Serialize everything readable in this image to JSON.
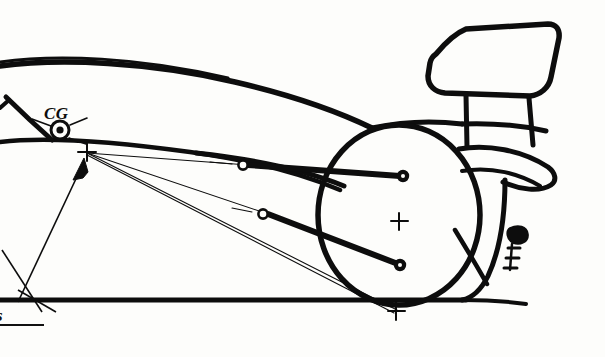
{
  "figure": {
    "type": "technical-line-drawing",
    "medium": "hand-drawn ink sketch",
    "background_color": "#fdfdfb",
    "ink_color": "#0d0d0d",
    "width": 605,
    "height": 357
  },
  "labels": {
    "cg": "CG",
    "cg_meaning": "center of gravity",
    "roll_center_height": "s",
    "roll_center_height_underlined": true
  },
  "markers": {
    "cg_symbol": {
      "name": "center-of-gravity-symbol",
      "x": 60,
      "y": 130,
      "outer_radius": 9,
      "inner_dot_radius": 3.5,
      "tick_count": 3
    },
    "instant_center_cross": {
      "name": "instant-center-cross",
      "x": 86,
      "y": 152,
      "size": 9
    },
    "wheel_center_cross": {
      "name": "wheel-center-cross",
      "x": 399,
      "y": 221,
      "size": 9
    },
    "contact_patch_cross": {
      "name": "tire-contact-patch-cross",
      "x": 396,
      "y": 311,
      "size": 9
    }
  },
  "wheel": {
    "name": "rear-wheel",
    "center_x": 399,
    "center_y": 215,
    "radius_x": 81,
    "radius_y": 90,
    "stroke_width": 5
  },
  "pivots": {
    "upper_inboard": {
      "x": 243,
      "y": 165,
      "style": "hollow",
      "radius": 4.5
    },
    "lower_inboard": {
      "x": 263,
      "y": 214,
      "style": "hollow",
      "radius": 4.5
    },
    "upper_outboard": {
      "x": 403,
      "y": 176,
      "style": "filled",
      "radius": 5
    },
    "lower_outboard": {
      "x": 400,
      "y": 265,
      "style": "filled",
      "radius": 5
    }
  },
  "arms": {
    "upper_control_arm": {
      "from_x": 243,
      "from_y": 165,
      "to_x": 403,
      "to_y": 176,
      "stroke_width": 6
    },
    "lower_control_arm": {
      "from_x": 263,
      "from_y": 214,
      "to_x": 400,
      "to_y": 265,
      "stroke_width": 6
    }
  },
  "construction_lines": [
    {
      "name": "upper-arm-projection",
      "from_x": 86,
      "from_y": 152,
      "to_x": 243,
      "to_y": 165
    },
    {
      "name": "lower-arm-projection",
      "from_x": 86,
      "from_y": 152,
      "to_x": 263,
      "to_y": 214
    },
    {
      "name": "contact-patch-projection",
      "from_x": 86,
      "from_y": 152,
      "to_x": 396,
      "to_y": 311
    },
    {
      "name": "roll-axis-line",
      "from_x": 86,
      "from_y": 152,
      "to_x": 396,
      "to_y": 313
    }
  ],
  "dimension_arrow": {
    "name": "roll-center-height-arrow",
    "from_x": 16,
    "from_y": 300,
    "to_x": 84,
    "to_y": 160,
    "head": "at-top"
  },
  "ground_line": {
    "name": "ground-reference-line",
    "y": 300,
    "from_x": 0,
    "to_x": 470,
    "stroke_width": 5
  },
  "bodywork": {
    "engine_cover_top": "sweeping curve from upper-left to rear wheel",
    "sidepod_line": "lower curve from left edge to wheel",
    "rear_wing": {
      "name": "rear-wing",
      "supports": 2
    },
    "diffuser": "rear lower bodywork",
    "rear_detail_count": 3
  }
}
